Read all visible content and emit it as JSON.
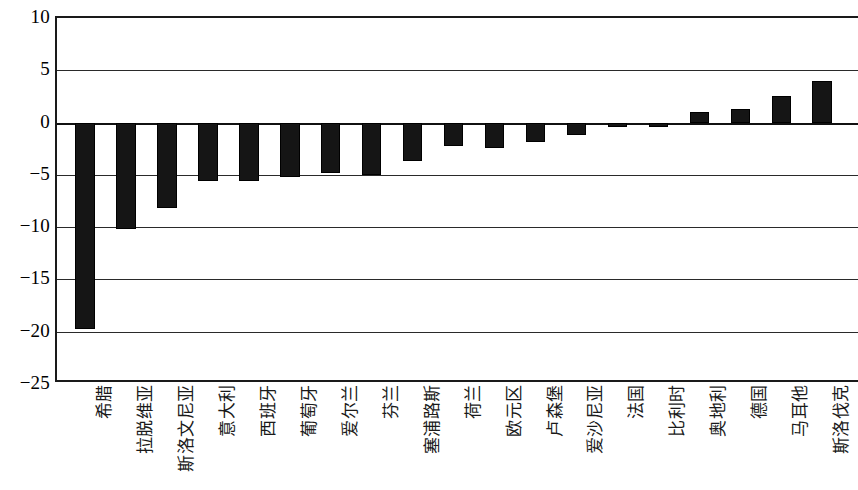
{
  "chart_data": {
    "type": "bar",
    "title": "",
    "subtitle": "",
    "xlabel": "",
    "ylabel": "",
    "ylim": [
      -25,
      10
    ],
    "yticks": [
      10,
      5,
      0,
      -5,
      -10,
      -15,
      -20,
      -25
    ],
    "ytick_labels": [
      "10",
      "5",
      "0",
      "−5",
      "−10",
      "−15",
      "−20",
      "−25"
    ],
    "grid": true,
    "legend": "none",
    "bar_color": "#151515",
    "axis_color": "#1a1a1a",
    "background_color": "#ffffff",
    "categories": [
      "希腊",
      "拉脱维亚",
      "斯洛文尼亚",
      "意大利",
      "西班牙",
      "葡萄牙",
      "爱尔兰",
      "芬兰",
      "塞浦路斯",
      "荷兰",
      "欧元区",
      "卢森堡",
      "爱沙尼亚",
      "法国",
      "比利时",
      "奥地利",
      "德国",
      "马耳他",
      "斯洛伐克"
    ],
    "values": [
      -19.7,
      -10.2,
      -8.2,
      -5.6,
      -5.6,
      -5.2,
      -4.8,
      -5.0,
      -3.7,
      -2.2,
      -2.4,
      -1.9,
      -1.2,
      -0.4,
      -0.4,
      1.0,
      1.3,
      2.5,
      4.0
    ]
  }
}
